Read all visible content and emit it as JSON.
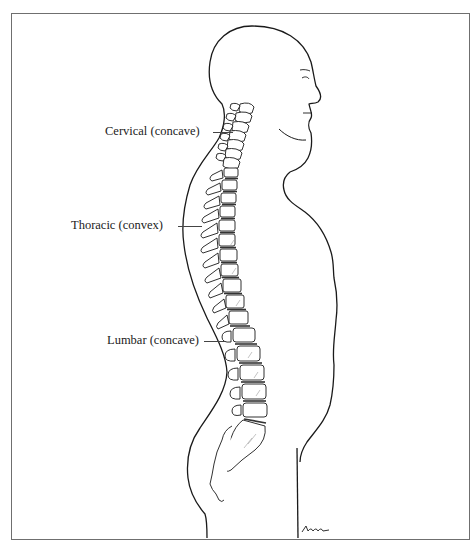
{
  "figure": {
    "labels": [
      {
        "id": "cervical",
        "text": "Cervical (concave)"
      },
      {
        "id": "thoracic",
        "text": "Thoracic (convex)"
      },
      {
        "id": "lumbar",
        "text": "Lumbar (concave)"
      }
    ],
    "signature": "Amm",
    "colors": {
      "line": "#1a1a1a",
      "frame": "#6f6f6f",
      "shade": "#9a9a9a",
      "background": "#ffffff"
    }
  }
}
